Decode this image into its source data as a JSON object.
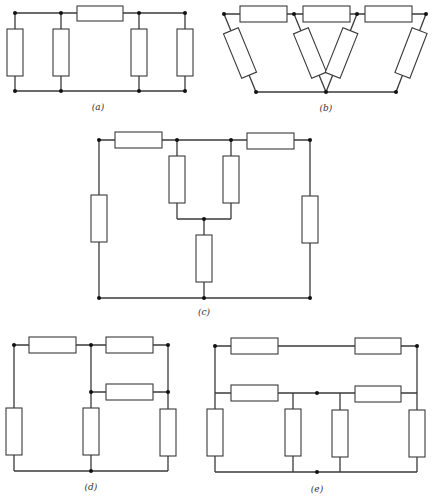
{
  "figure": {
    "colors": {
      "line": "#3a3a3a",
      "node": "#111111",
      "resistor_fill": "#ffffff",
      "background": "#ffffff"
    }
  },
  "circuits": [
    {
      "id": "a",
      "label": "(a)",
      "resistor_count": 5,
      "node_count": 8
    },
    {
      "id": "b",
      "label": "(b)",
      "resistor_count": 7,
      "node_count": 7
    },
    {
      "id": "c",
      "label": "(c)",
      "resistor_count": 7,
      "node_count": 7
    },
    {
      "id": "d",
      "label": "(d)",
      "resistor_count": 7,
      "node_count": 6
    },
    {
      "id": "e",
      "label": "(e)",
      "resistor_count": 8,
      "node_count": 4
    }
  ]
}
